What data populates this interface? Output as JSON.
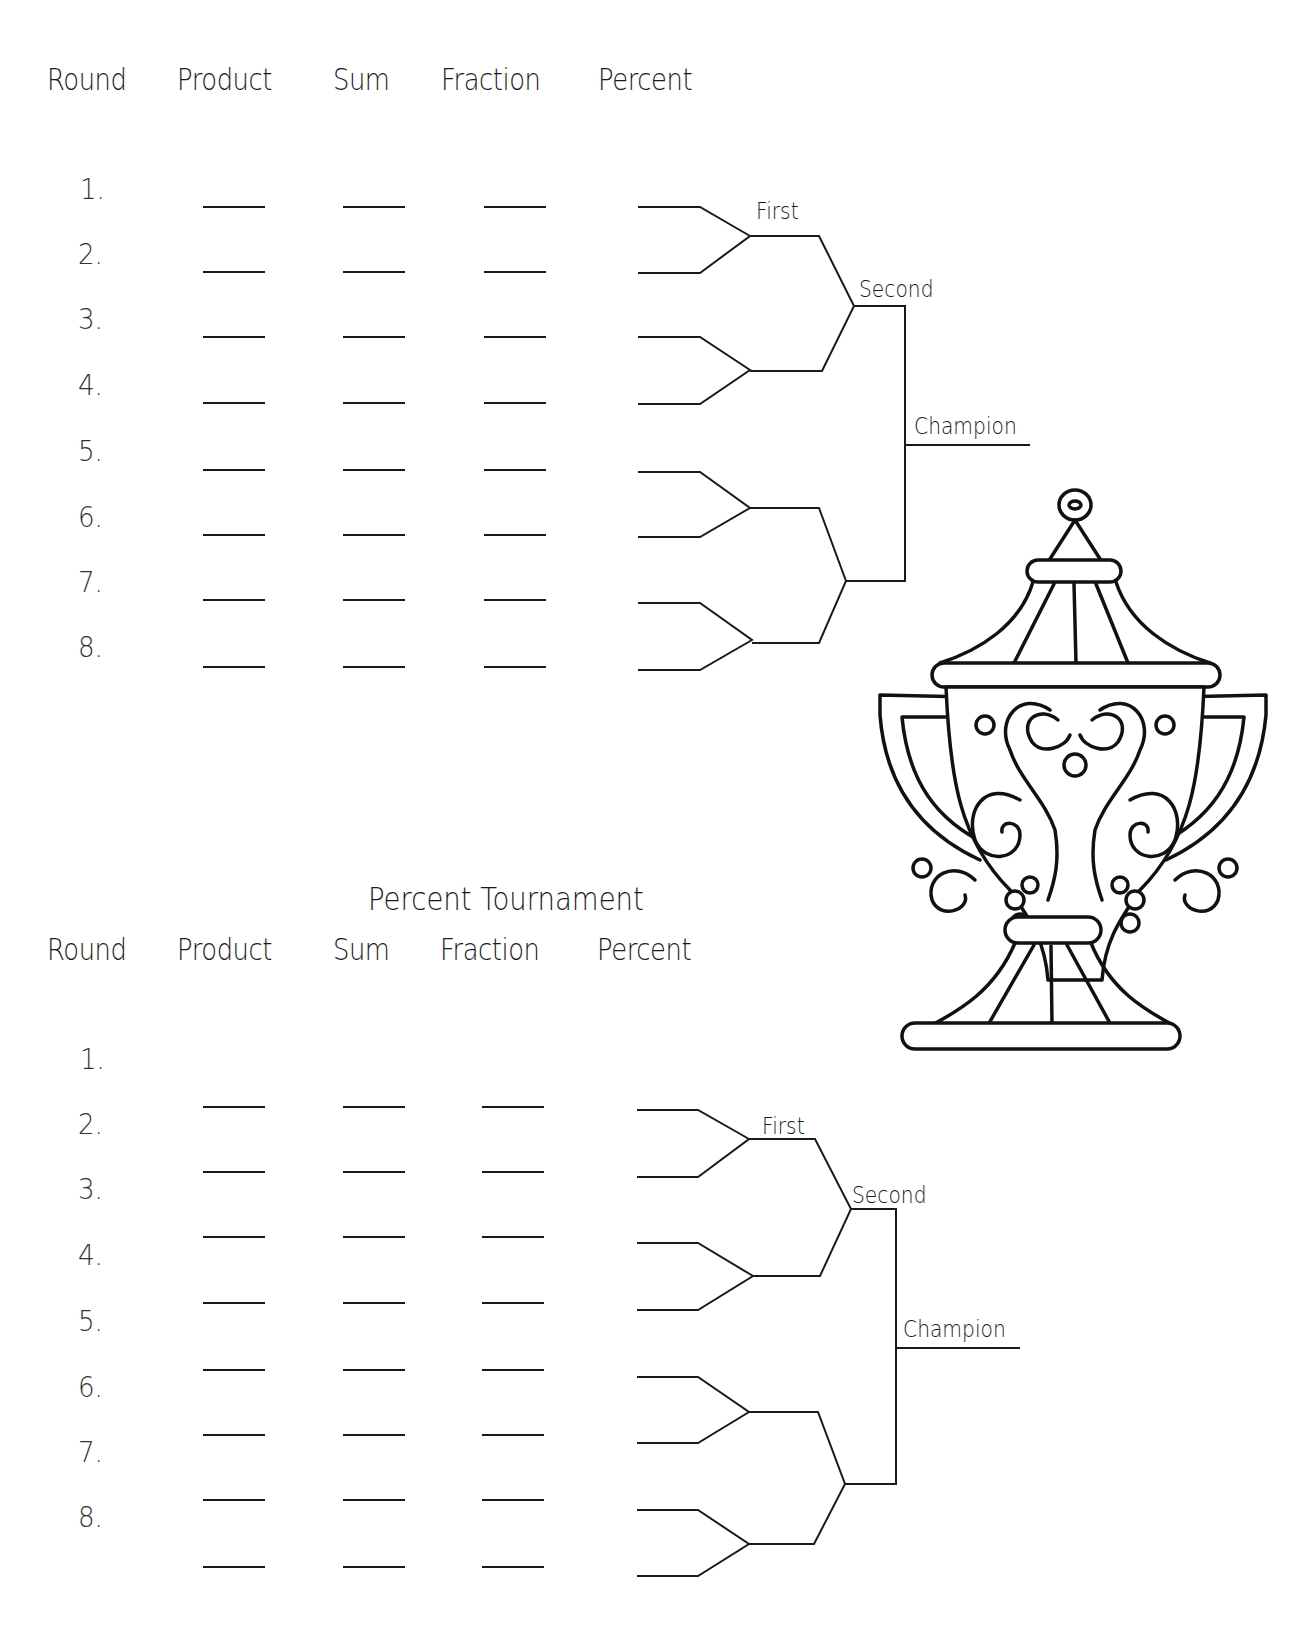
{
  "sections": [
    {
      "title": "",
      "headers": {
        "round": "Round",
        "product": "Product",
        "sum": "Sum",
        "fraction": "Fraction",
        "percent": "Percent"
      },
      "rounds": [
        "1.",
        "2.",
        "3.",
        "4.",
        "5.",
        "6.",
        "7.",
        "8."
      ],
      "bracket": {
        "first": "First",
        "second": "Second",
        "champion": "Champion"
      }
    },
    {
      "title": "Percent Tournament",
      "headers": {
        "round": "Round",
        "product": "Product",
        "sum": "Sum",
        "fraction": "Fraction",
        "percent": "Percent"
      },
      "rounds": [
        "1.",
        "2.",
        "3.",
        "4.",
        "5.",
        "6.",
        "7.",
        "8."
      ],
      "bracket": {
        "first": "First",
        "second": "Second",
        "champion": "Champion"
      }
    }
  ],
  "illustration": {
    "icon": "trophy-icon"
  },
  "colors": {
    "ink": "#1a1a1a",
    "background": "#ffffff"
  }
}
